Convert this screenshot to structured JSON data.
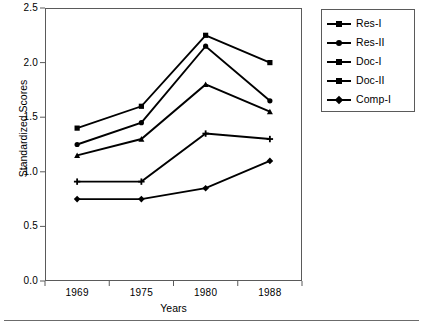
{
  "chart_data": {
    "type": "line",
    "title": "",
    "xlabel": "Years",
    "ylabel": "Standardized Scores",
    "categories": [
      "1969",
      "1975",
      "1980",
      "1988"
    ],
    "ylim": [
      0.0,
      2.5
    ],
    "yticks": [
      "0.0",
      "0.5",
      "1.0",
      "1.5",
      "2.0",
      "2.5"
    ],
    "ytick_values": [
      0.0,
      0.5,
      1.0,
      1.5,
      2.0,
      2.5
    ],
    "grid": false,
    "legend_position": "right-outside",
    "series": [
      {
        "name": "Res-I",
        "marker": "square",
        "color": "#000000",
        "values": [
          1.4,
          1.6,
          2.25,
          2.0
        ]
      },
      {
        "name": "Res-II",
        "marker": "circle",
        "color": "#000000",
        "values": [
          1.25,
          1.45,
          2.15,
          1.65
        ]
      },
      {
        "name": "Doc-I",
        "marker": "triangle",
        "color": "#000000",
        "values": [
          1.15,
          1.3,
          1.8,
          1.55
        ]
      },
      {
        "name": "Doc-II",
        "marker": "plus",
        "color": "#000000",
        "values": [
          0.91,
          0.91,
          1.35,
          1.3
        ]
      },
      {
        "name": "Comp-I",
        "marker": "diamond",
        "color": "#000000",
        "values": [
          0.75,
          0.75,
          0.85,
          1.1
        ]
      }
    ]
  },
  "legend": {
    "items": [
      {
        "label": "Res-I"
      },
      {
        "label": "Res-II"
      },
      {
        "label": "Doc-I"
      },
      {
        "label": "Doc-II"
      },
      {
        "label": "Comp-I"
      }
    ]
  },
  "caption": {
    "text": ""
  }
}
